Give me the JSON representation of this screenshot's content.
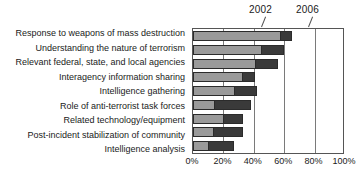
{
  "chart_data": {
    "type": "bar",
    "orientation": "horizontal",
    "stacked": true,
    "title": "",
    "xlabel": "",
    "ylabel": "",
    "xlim": [
      0,
      100
    ],
    "grid": true,
    "legend_position": "annotation-callouts-top",
    "categories": [
      "Response to weapons of mass destruction",
      "Understanding the nature of terrorism",
      "Relevant federal, state, and local agencies",
      "Interagency information sharing",
      "Intelligence gathering",
      "Role of anti-terrorist task forces",
      "Related technology/equipment",
      "Post-incident stabilization of community",
      "Intelligence analysis"
    ],
    "series": [
      {
        "name": "2002",
        "color": "#9a9a9a",
        "values": [
          57,
          45,
          41,
          32,
          27,
          14,
          20,
          13,
          10
        ]
      },
      {
        "name": "2006",
        "color": "#3a3a3a",
        "values": [
          8,
          15,
          15,
          9,
          15,
          24,
          13,
          20,
          17
        ]
      }
    ],
    "cumulative_totals": [
      65,
      60,
      56,
      41,
      42,
      38,
      33,
      33,
      27
    ],
    "xticks": [
      0,
      20,
      40,
      60,
      80,
      100
    ],
    "xtick_labels": [
      "0%",
      "20%",
      "40%",
      "60%",
      "80%",
      "100%"
    ],
    "annotations": [
      {
        "text": "2002",
        "points_to_series": "2002"
      },
      {
        "text": "2006",
        "points_to_series": "2006"
      }
    ]
  },
  "annotations": {
    "a2002": "2002",
    "a2006": "2006"
  }
}
